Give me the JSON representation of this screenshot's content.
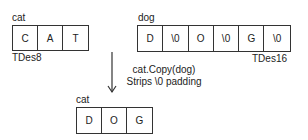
{
  "source": {
    "name": "cat",
    "type_label": "TDes8",
    "cells": [
      "C",
      "A",
      "T"
    ]
  },
  "target": {
    "name": "dog",
    "type_label": "TDes16",
    "cells": [
      "D",
      "\\0",
      "O",
      "\\0",
      "G",
      "\\0"
    ]
  },
  "operation": {
    "call": "cat.Copy(dog)",
    "note": "Strips \\0 padding",
    "arrow_icon": "arrow-down-icon"
  },
  "result": {
    "name": "cat",
    "cells": [
      "D",
      "O",
      "G"
    ]
  }
}
